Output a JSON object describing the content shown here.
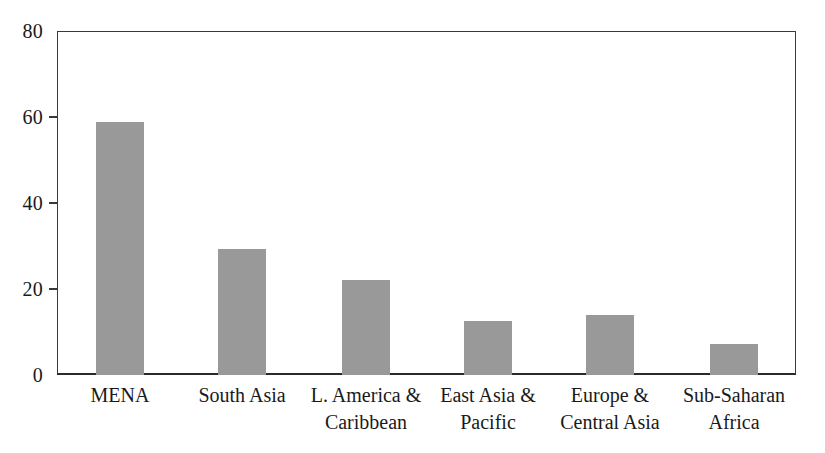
{
  "chart_data": {
    "type": "bar",
    "title": "",
    "subtitle": "",
    "xlabel": "",
    "ylabel": "",
    "categories": [
      "MENA",
      "South Asia",
      "L. America & Caribbean",
      "East Asia & Pacific",
      "Europe & Central Asia",
      "Sub-Saharan Africa"
    ],
    "category_lines": [
      [
        "MENA",
        ""
      ],
      [
        "South Asia",
        ""
      ],
      [
        "L. America &",
        "Caribbean"
      ],
      [
        "East Asia &",
        "Pacific"
      ],
      [
        "Europe &",
        "Central Asia"
      ],
      [
        "Sub-Saharan",
        "Africa"
      ]
    ],
    "values": [
      58.8,
      29.4,
      22.2,
      12.6,
      14.0,
      7.2
    ],
    "ylim": [
      0,
      80
    ],
    "yticks": [
      0,
      20,
      40,
      60,
      80
    ],
    "ytick_labels": [
      "0",
      "20",
      "40",
      "60",
      "80"
    ],
    "grid": false,
    "legend": null,
    "legend_position": "none",
    "bar_color": "#999999",
    "axis_color": "#3a3a3a",
    "text_color": "#1a1a1a",
    "background_color": "#ffffff"
  }
}
